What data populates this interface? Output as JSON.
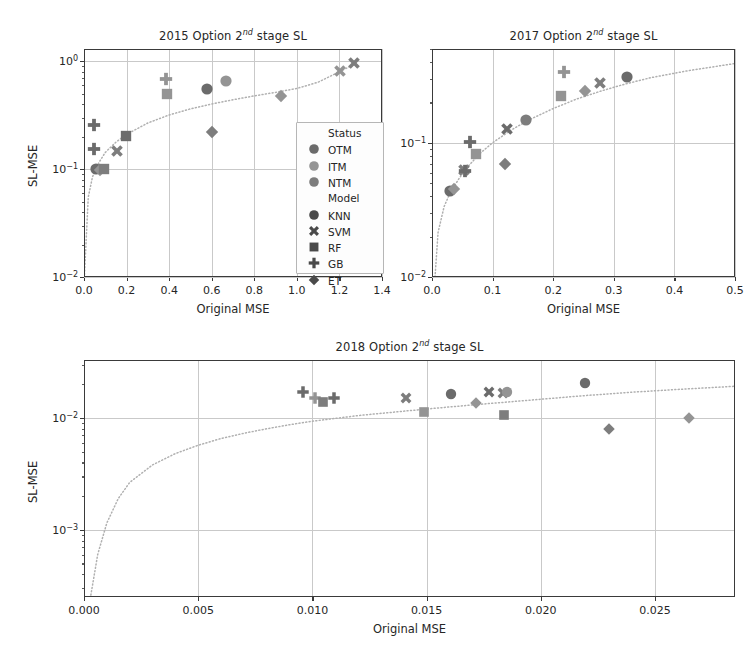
{
  "figure": {
    "width": 756,
    "height": 654,
    "background": "#ffffff",
    "axis_color": "#3a3a3a",
    "grid_color": "#c9c9c9",
    "trend_line_color": "#b0b0b0"
  },
  "legend": {
    "group1_title": "Status",
    "group2_title": "Model",
    "status_items": [
      {
        "label": "OTM",
        "color": "#6b6b6b"
      },
      {
        "label": "ITM",
        "color": "#949494"
      },
      {
        "label": "NTM",
        "color": "#7d7d7d"
      }
    ],
    "model_items": [
      {
        "label": "KNN",
        "marker": "circle"
      },
      {
        "label": "SVM",
        "marker": "x"
      },
      {
        "label": "RF",
        "marker": "square"
      },
      {
        "label": "GB",
        "marker": "plus"
      },
      {
        "label": "ET",
        "marker": "diamond"
      }
    ]
  },
  "chart_data": [
    {
      "id": "panel-2015",
      "type": "scatter",
      "title": "2015 Option 2nd stage SL",
      "title_year": "2015",
      "title_rest": " Option 2",
      "title_sup": "nd",
      "title_tail": " stage SL",
      "xlabel": "Original MSE",
      "ylabel": "SL-MSE",
      "xscale": "linear",
      "yscale": "log",
      "xlim": [
        0.0,
        1.4
      ],
      "ylim": [
        0.01,
        1.3
      ],
      "xticks": [
        "0.0",
        "0.2",
        "0.4",
        "0.6",
        "0.8",
        "1.0",
        "1.2",
        "1.4"
      ],
      "xtick_values": [
        0.0,
        0.2,
        0.4,
        0.6,
        0.8,
        1.0,
        1.2,
        1.4
      ],
      "yticks": [
        "10^0",
        "10^-1",
        "10^-2"
      ],
      "ytick_values": [
        1.0,
        0.1,
        0.01
      ],
      "grid": true,
      "has_legend": true,
      "points": [
        {
          "x": 0.055,
          "y": 0.1,
          "model": "circle",
          "status": "OTM"
        },
        {
          "x": 0.075,
          "y": 0.098,
          "model": "diamond",
          "status": "ITM"
        },
        {
          "x": 0.095,
          "y": 0.1,
          "model": "square",
          "status": "NTM"
        },
        {
          "x": 0.045,
          "y": 0.155,
          "model": "plus",
          "status": "OTM"
        },
        {
          "x": 0.045,
          "y": 0.255,
          "model": "plus",
          "status": "OTM"
        },
        {
          "x": 0.155,
          "y": 0.148,
          "model": "x",
          "status": "NTM"
        },
        {
          "x": 0.195,
          "y": 0.205,
          "model": "square",
          "status": "OTM"
        },
        {
          "x": 0.39,
          "y": 0.5,
          "model": "square",
          "status": "ITM"
        },
        {
          "x": 0.385,
          "y": 0.69,
          "model": "plus",
          "status": "ITM"
        },
        {
          "x": 0.58,
          "y": 0.555,
          "model": "circle",
          "status": "OTM"
        },
        {
          "x": 0.665,
          "y": 0.65,
          "model": "circle",
          "status": "ITM"
        },
        {
          "x": 0.6,
          "y": 0.222,
          "model": "diamond",
          "status": "NTM"
        },
        {
          "x": 0.925,
          "y": 0.475,
          "model": "diamond",
          "status": "ITM"
        },
        {
          "x": 1.205,
          "y": 0.815,
          "model": "x",
          "status": "ITM"
        },
        {
          "x": 1.27,
          "y": 0.965,
          "model": "x",
          "status": "NTM"
        }
      ],
      "trend": [
        [
          0.0,
          0.0085
        ],
        [
          0.02,
          0.055
        ],
        [
          0.04,
          0.085
        ],
        [
          0.07,
          0.115
        ],
        [
          0.1,
          0.143
        ],
        [
          0.15,
          0.178
        ],
        [
          0.2,
          0.21
        ],
        [
          0.3,
          0.268
        ],
        [
          0.4,
          0.318
        ],
        [
          0.5,
          0.362
        ],
        [
          0.6,
          0.402
        ],
        [
          0.7,
          0.44
        ],
        [
          0.8,
          0.478
        ],
        [
          0.9,
          0.515
        ],
        [
          1.0,
          0.56
        ],
        [
          1.1,
          0.64
        ],
        [
          1.2,
          0.8
        ],
        [
          1.28,
          0.96
        ]
      ]
    },
    {
      "id": "panel-2017",
      "type": "scatter",
      "title": "2017 Option 2nd stage SL",
      "title_year": "2017",
      "title_rest": " Option 2",
      "title_sup": "nd",
      "title_tail": " stage SL",
      "xlabel": "Original MSE",
      "ylabel": "",
      "xscale": "linear",
      "yscale": "log",
      "xlim": [
        0.0,
        0.5
      ],
      "ylim": [
        0.01,
        0.5
      ],
      "xticks": [
        "0.0",
        "0.1",
        "0.2",
        "0.3",
        "0.4",
        "0.5"
      ],
      "xtick_values": [
        0.0,
        0.1,
        0.2,
        0.3,
        0.4,
        0.5
      ],
      "yticks": [
        "10^-1",
        "10^-2"
      ],
      "ytick_values": [
        0.1,
        0.01
      ],
      "grid": true,
      "has_legend": false,
      "points": [
        {
          "x": 0.03,
          "y": 0.0435,
          "model": "circle",
          "status": "OTM"
        },
        {
          "x": 0.036,
          "y": 0.0455,
          "model": "diamond",
          "status": "ITM"
        },
        {
          "x": 0.052,
          "y": 0.0625,
          "model": "x",
          "status": "NTM"
        },
        {
          "x": 0.055,
          "y": 0.062,
          "model": "plus",
          "status": "OTM"
        },
        {
          "x": 0.072,
          "y": 0.083,
          "model": "square",
          "status": "ITM"
        },
        {
          "x": 0.063,
          "y": 0.101,
          "model": "plus",
          "status": "OTM"
        },
        {
          "x": 0.12,
          "y": 0.07,
          "model": "diamond",
          "status": "NTM"
        },
        {
          "x": 0.123,
          "y": 0.127,
          "model": "x",
          "status": "OTM"
        },
        {
          "x": 0.155,
          "y": 0.147,
          "model": "circle",
          "status": "NTM"
        },
        {
          "x": 0.213,
          "y": 0.225,
          "model": "square",
          "status": "ITM"
        },
        {
          "x": 0.218,
          "y": 0.335,
          "model": "plus",
          "status": "ITM"
        },
        {
          "x": 0.252,
          "y": 0.245,
          "model": "diamond",
          "status": "ITM"
        },
        {
          "x": 0.278,
          "y": 0.28,
          "model": "x",
          "status": "NTM"
        },
        {
          "x": 0.322,
          "y": 0.31,
          "model": "circle",
          "status": "OTM"
        }
      ],
      "trend": [
        [
          0.005,
          0.01
        ],
        [
          0.01,
          0.0215
        ],
        [
          0.02,
          0.0335
        ],
        [
          0.03,
          0.0425
        ],
        [
          0.045,
          0.0545
        ],
        [
          0.06,
          0.067
        ],
        [
          0.08,
          0.084
        ],
        [
          0.1,
          0.1
        ],
        [
          0.13,
          0.124
        ],
        [
          0.16,
          0.148
        ],
        [
          0.2,
          0.18
        ],
        [
          0.24,
          0.213
        ],
        [
          0.28,
          0.244
        ],
        [
          0.32,
          0.275
        ],
        [
          0.36,
          0.305
        ],
        [
          0.42,
          0.343
        ],
        [
          0.5,
          0.39
        ]
      ]
    },
    {
      "id": "panel-2018",
      "type": "scatter",
      "title": "2018 Option 2nd stage SL",
      "title_year": "2018",
      "title_rest": " Option 2",
      "title_sup": "nd",
      "title_tail": " stage SL",
      "xlabel": "Original MSE",
      "ylabel": "SL-MSE",
      "xscale": "linear",
      "yscale": "log",
      "xlim": [
        0.0,
        0.0285
      ],
      "ylim": [
        0.00025,
        0.033
      ],
      "xticks": [
        "0.000",
        "0.005",
        "0.010",
        "0.015",
        "0.020",
        "0.025"
      ],
      "xtick_values": [
        0.0,
        0.005,
        0.01,
        0.015,
        0.02,
        0.025
      ],
      "yticks": [
        "10^-2",
        "10^-3"
      ],
      "ytick_values": [
        0.01,
        0.001
      ],
      "grid": true,
      "has_legend": false,
      "points": [
        {
          "x": 0.0096,
          "y": 0.017,
          "model": "plus",
          "status": "OTM"
        },
        {
          "x": 0.0101,
          "y": 0.0152,
          "model": "plus",
          "status": "ITM"
        },
        {
          "x": 0.01045,
          "y": 0.014,
          "model": "square",
          "status": "NTM"
        },
        {
          "x": 0.01095,
          "y": 0.0152,
          "model": "plus",
          "status": "OTM"
        },
        {
          "x": 0.0141,
          "y": 0.015,
          "model": "x",
          "status": "NTM"
        },
        {
          "x": 0.0149,
          "y": 0.0113,
          "model": "square",
          "status": "ITM"
        },
        {
          "x": 0.01605,
          "y": 0.0164,
          "model": "circle",
          "status": "OTM"
        },
        {
          "x": 0.01715,
          "y": 0.0137,
          "model": "diamond",
          "status": "ITM"
        },
        {
          "x": 0.01775,
          "y": 0.017,
          "model": "x",
          "status": "OTM"
        },
        {
          "x": 0.01835,
          "y": 0.0168,
          "model": "x",
          "status": "NTM"
        },
        {
          "x": 0.0185,
          "y": 0.0172,
          "model": "circle",
          "status": "ITM"
        },
        {
          "x": 0.0184,
          "y": 0.0106,
          "model": "square",
          "status": "NTM"
        },
        {
          "x": 0.02195,
          "y": 0.0205,
          "model": "circle",
          "status": "OTM"
        },
        {
          "x": 0.023,
          "y": 0.0079,
          "model": "diamond",
          "status": "NTM"
        },
        {
          "x": 0.0265,
          "y": 0.01,
          "model": "diamond",
          "status": "ITM"
        }
      ],
      "trend": [
        [
          0.0003,
          0.00026
        ],
        [
          0.0006,
          0.0006
        ],
        [
          0.001,
          0.00115
        ],
        [
          0.0015,
          0.0019
        ],
        [
          0.002,
          0.00265
        ],
        [
          0.003,
          0.0038
        ],
        [
          0.004,
          0.0048
        ],
        [
          0.005,
          0.0057
        ],
        [
          0.006,
          0.00655
        ],
        [
          0.007,
          0.0073
        ],
        [
          0.008,
          0.008
        ],
        [
          0.009,
          0.0087
        ],
        [
          0.01,
          0.00935
        ],
        [
          0.012,
          0.0105
        ],
        [
          0.014,
          0.0115
        ],
        [
          0.016,
          0.01255
        ],
        [
          0.018,
          0.0136
        ],
        [
          0.02,
          0.0147
        ],
        [
          0.022,
          0.0159
        ],
        [
          0.024,
          0.017
        ],
        [
          0.026,
          0.018
        ],
        [
          0.0285,
          0.0192
        ]
      ]
    }
  ]
}
